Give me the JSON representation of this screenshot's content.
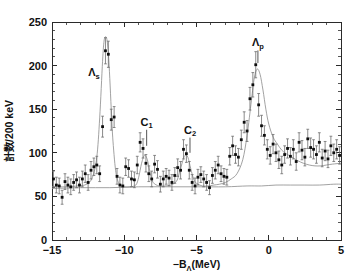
{
  "figure": {
    "background_color": "#ffffff",
    "marker_color": "#0d0d0d",
    "curve_color": "#8a8a8a",
    "axis_color": "#2a2a2a"
  },
  "axes": {
    "x_title": "−Bₗ(MeV)",
    "x_title_main": "−B",
    "x_title_sub": "Λ",
    "x_title_unit": "(MeV)",
    "y_title_prefix": "計数",
    "y_title_suffix": "/200 keV",
    "x_ticklabels": [
      "−15",
      "−10",
      "−5",
      "0",
      "5"
    ],
    "y_ticklabels": [
      "0",
      "50",
      "100",
      "150",
      "200",
      "250"
    ]
  },
  "annotations": [
    {
      "name": "lambda-s",
      "base": "Λ",
      "sub": "s",
      "x": -12.1,
      "y": 188,
      "line_to_y": null
    },
    {
      "name": "c1",
      "base": "C",
      "sub": "1",
      "x": -8.45,
      "y": 131,
      "line_to_y": 108
    },
    {
      "name": "c2",
      "base": "C",
      "sub": "2",
      "x": -5.45,
      "y": 122,
      "line_to_y": 100
    },
    {
      "name": "lambda-p",
      "base": "Λ",
      "sub": "p",
      "x": -0.75,
      "y": 222,
      "line_to_y": 203
    }
  ],
  "chart_data": {
    "type": "scatter",
    "title": "",
    "xlabel": "−BΛ (MeV)",
    "ylabel": "計数 /200 keV",
    "xlim": [
      -15,
      5
    ],
    "ylim": [
      0,
      250
    ],
    "xticks": [
      -15,
      -10,
      -5,
      0,
      5
    ],
    "yticks": [
      0,
      50,
      100,
      150,
      200,
      250
    ],
    "grid": false,
    "legend": null,
    "bin_width": 0.2,
    "errorbar_mode": "sqrt(N)",
    "x": [
      -14.9,
      -14.7,
      -14.5,
      -14.3,
      -14.1,
      -13.9,
      -13.7,
      -13.5,
      -13.3,
      -13.1,
      -12.9,
      -12.7,
      -12.5,
      -12.3,
      -12.1,
      -11.9,
      -11.7,
      -11.5,
      -11.3,
      -11.1,
      -10.9,
      -10.7,
      -10.5,
      -10.3,
      -10.1,
      -9.9,
      -9.7,
      -9.5,
      -9.3,
      -9.1,
      -8.9,
      -8.7,
      -8.5,
      -8.3,
      -8.1,
      -7.9,
      -7.7,
      -7.5,
      -7.3,
      -7.1,
      -6.9,
      -6.7,
      -6.5,
      -6.3,
      -6.1,
      -5.9,
      -5.7,
      -5.5,
      -5.3,
      -5.1,
      -4.9,
      -4.7,
      -4.5,
      -4.3,
      -4.1,
      -3.9,
      -3.7,
      -3.5,
      -3.3,
      -3.1,
      -2.9,
      -2.7,
      -2.5,
      -2.3,
      -2.1,
      -1.9,
      -1.7,
      -1.5,
      -1.3,
      -1.1,
      -0.9,
      -0.7,
      -0.5,
      -0.3,
      -0.1,
      0.1,
      0.3,
      0.5,
      0.7,
      0.9,
      1.1,
      1.3,
      1.5,
      1.7,
      1.9,
      2.1,
      2.3,
      2.5,
      2.7,
      2.9,
      3.1,
      3.3,
      3.5,
      3.7,
      3.9,
      4.1,
      4.3,
      4.5,
      4.7,
      4.9
    ],
    "y": [
      70,
      63,
      62,
      49,
      67,
      63,
      61,
      66,
      69,
      63,
      70,
      76,
      66,
      80,
      84,
      86,
      76,
      130,
      217,
      213,
      138,
      141,
      73,
      63,
      62,
      84,
      82,
      70,
      69,
      86,
      112,
      105,
      88,
      76,
      70,
      87,
      81,
      64,
      70,
      73,
      71,
      66,
      74,
      83,
      80,
      104,
      99,
      80,
      66,
      62,
      72,
      75,
      70,
      66,
      60,
      74,
      80,
      86,
      76,
      73,
      72,
      96,
      108,
      98,
      95,
      115,
      135,
      125,
      162,
      178,
      201,
      155,
      131,
      120,
      104,
      97,
      110,
      100,
      92,
      86,
      98,
      105,
      96,
      104,
      90,
      112,
      103,
      95,
      116,
      106,
      104,
      98,
      112,
      94,
      102,
      93,
      108,
      100,
      104,
      97
    ],
    "yerr": [
      9,
      9,
      9,
      8,
      9,
      9,
      9,
      9,
      9,
      9,
      9,
      10,
      9,
      10,
      10,
      10,
      9,
      12,
      15,
      15,
      12,
      12,
      9,
      9,
      9,
      10,
      10,
      9,
      9,
      10,
      11,
      11,
      10,
      9,
      9,
      10,
      10,
      9,
      9,
      9,
      9,
      9,
      9,
      10,
      10,
      11,
      10,
      10,
      9,
      9,
      9,
      9,
      9,
      9,
      8,
      9,
      10,
      10,
      9,
      9,
      9,
      10,
      11,
      10,
      10,
      11,
      12,
      12,
      13,
      14,
      15,
      13,
      12,
      11,
      11,
      10,
      11,
      10,
      10,
      10,
      10,
      11,
      10,
      11,
      10,
      11,
      11,
      10,
      11,
      11,
      11,
      10,
      11,
      10,
      11,
      10,
      11,
      10,
      11,
      10
    ],
    "fit_curve": {
      "name": "total fit",
      "x": [
        -15.0,
        -14.0,
        -13.2,
        -12.6,
        -12.2,
        -11.9,
        -11.7,
        -11.5,
        -11.4,
        -11.3,
        -11.2,
        -11.1,
        -11.0,
        -10.9,
        -10.8,
        -10.6,
        -10.4,
        -10.2,
        -10.0,
        -9.6,
        -9.2,
        -9.0,
        -8.8,
        -8.6,
        -8.4,
        -8.2,
        -8.0,
        -7.6,
        -7.2,
        -6.8,
        -6.4,
        -6.2,
        -6.0,
        -5.8,
        -5.6,
        -5.4,
        -5.2,
        -5.0,
        -4.6,
        -4.2,
        -3.8,
        -3.4,
        -3.0,
        -2.6,
        -2.2,
        -1.8,
        -1.5,
        -1.2,
        -1.0,
        -0.8,
        -0.6,
        -0.4,
        -0.2,
        0.0,
        0.3,
        0.6,
        0.9,
        1.2,
        1.6,
        2.0,
        2.4,
        2.8,
        3.2,
        3.6,
        4.0,
        4.4,
        5.0
      ],
      "y": [
        61,
        61,
        62,
        64,
        72,
        95,
        140,
        205,
        228,
        233,
        230,
        214,
        185,
        150,
        118,
        80,
        66,
        62,
        61,
        61,
        63,
        72,
        88,
        97,
        92,
        76,
        66,
        62,
        62,
        63,
        67,
        76,
        88,
        97,
        95,
        82,
        70,
        65,
        62,
        62,
        63,
        64,
        66,
        70,
        76,
        92,
        120,
        160,
        186,
        196,
        190,
        172,
        150,
        133,
        118,
        110,
        103,
        99,
        95,
        91,
        88,
        86,
        85,
        85,
        86,
        87,
        88
      ]
    },
    "background_curve": {
      "name": "background",
      "x": [
        -15.0,
        -13.0,
        -11.0,
        -9.0,
        -7.0,
        -5.0,
        -3.0,
        -1.5,
        -0.5,
        0.5,
        1.5,
        2.5,
        3.5,
        4.5,
        5.0
      ],
      "y": [
        59,
        60,
        60,
        61,
        61,
        61,
        61,
        62,
        62,
        63,
        63,
        63,
        63,
        64,
        64
      ]
    }
  }
}
